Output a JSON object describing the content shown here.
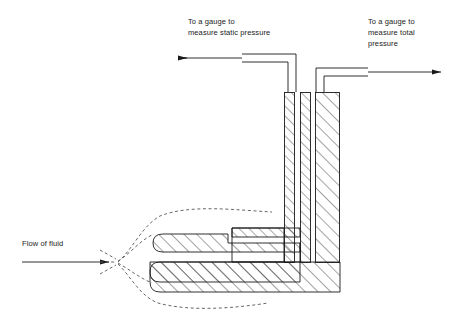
{
  "diagram": {
    "labels": {
      "static_gauge": "To a gauge to\nmeasure static pressure",
      "total_gauge": "To a gauge to\nmeasure total\npressure",
      "flow": "Flow of fluid"
    },
    "colors": {
      "line": "#1a1a1a",
      "hatch": "#333333",
      "dashed": "#555555",
      "background": "#ffffff"
    },
    "arrows": {
      "static_direction": "left",
      "total_direction": "right",
      "flow_direction": "right"
    }
  }
}
